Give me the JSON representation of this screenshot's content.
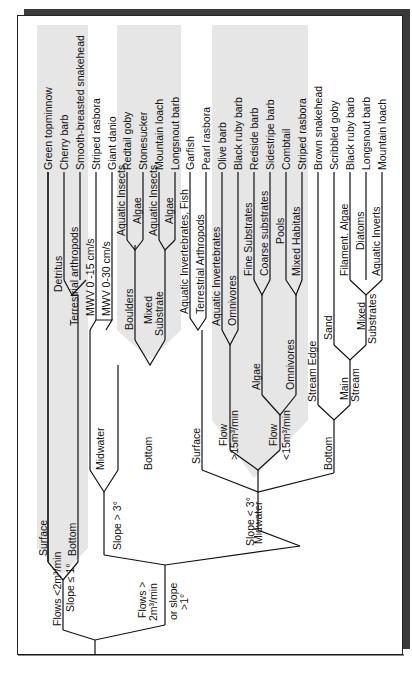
{
  "diagram": {
    "orientation": "rotated-90-ccw",
    "shade_color": "#e6e6e6",
    "leaves": [
      "Green topminnow",
      "Cherry barb",
      "Smooth-breasted snakehead",
      "Striped rasbora",
      "Giant danio",
      "Redtail goby",
      "Stonesucker",
      "Mountain loach",
      "Longsnout barb",
      "Garfish",
      "Pearl rasbora",
      "Olive barb",
      "Black ruby barb",
      "Redside barb",
      "Sidestripe barb",
      "Combtail",
      "Striped rasbora",
      "Brown snakehead",
      "Scribbled goby",
      "Black ruby barb",
      "Longsnout barb",
      "Mountain loach"
    ],
    "labels": {
      "flows_low": "Flows <2m³/min",
      "slope_low": "Slope ≤ 1°",
      "flows_high_1": "Flows >",
      "flows_high_2": "2m³/min",
      "flows_high_3": "or slope",
      "flows_high_4": ">1°",
      "surface_1": "Surface",
      "bottom_1": "Bottom",
      "detritus": "Detritus",
      "terr_arth_1": "Terrestrial arthropods",
      "slope_gt3": "Slope > 3°",
      "midwater_1": "Midwater",
      "bottom_2": "Bottom",
      "mwv15": "MWV 0 -15 cm/s",
      "mwv30": "MWV 0-30 cm/s",
      "boulders": "Boulders",
      "mixed_substrate_1": "Mixed",
      "mixed_substrate_2": "Substrate",
      "aq_insects_1": "Aquatic Insects",
      "algae_1": "Algae",
      "aq_insects_2": "Aquatic Insects",
      "algae_2": "Algae",
      "slope_lt3": "Slope < 3°",
      "surface_2": "Surface",
      "midwater_2": "Midwater",
      "bottom_3": "Bottom",
      "aq_inv_fish": "Aquatic Invertebrates, Fish",
      "terr_arth_2": "Terrestrial Arthropods",
      "flow_hi_1": "Flow",
      "flow_hi_2": ">15m³/min",
      "flow_lo_1": "Flow",
      "flow_lo_2": "<15m³/min",
      "aq_inv": "Aquatic Invertebrates",
      "omnivores_1": "Omnivores",
      "algae_3": "Algae",
      "omnivores_2": "Omnivores",
      "fine_sub": "Fine Substrates",
      "coarse_sub": "Coarse substrates",
      "pools": "Pools",
      "mixed_hab": "Mixed Habitats",
      "stream_edge": "Stream Edge",
      "main_stream_1": "Main",
      "main_stream_2": "Stream",
      "sand": "Sand",
      "mixed_subs_1": "Mixed",
      "mixed_subs_2": "Substrates",
      "filament_algae": "Filament. Algae",
      "diatoms": "Diatoms",
      "aq_inverts": "Aquatic Inverts"
    }
  }
}
